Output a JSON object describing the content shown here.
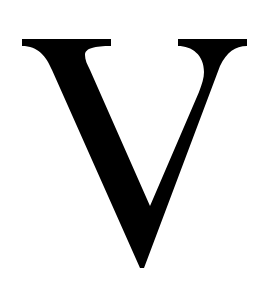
{
  "image": {
    "letter": "V",
    "description": "Single black serif capital letter V on white background",
    "colors": {
      "glyph": "#000000",
      "background": "#ffffff"
    }
  }
}
